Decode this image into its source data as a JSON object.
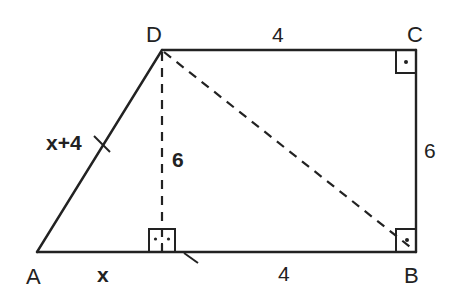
{
  "diagram": {
    "type": "right trapezoid",
    "colors": {
      "stroke": "#222222",
      "background": "#ffffff"
    },
    "vertices": {
      "A": {
        "label": "A",
        "x": 37,
        "y": 252
      },
      "B": {
        "label": "B",
        "x": 416,
        "y": 252
      },
      "C": {
        "label": "C",
        "x": 416,
        "y": 50
      },
      "D": {
        "label": "D",
        "x": 162,
        "y": 50
      },
      "H": {
        "x": 162,
        "y": 252
      }
    },
    "segment_labels": {
      "AD": "x+4",
      "DH": "6",
      "AH": "x",
      "HB": "4",
      "DC": "4",
      "CB": "6"
    },
    "dashed_segments": [
      "DH",
      "DB"
    ],
    "right_angles": [
      "C",
      "H",
      "B"
    ],
    "tick_marks": [
      "AD",
      "HB"
    ]
  }
}
